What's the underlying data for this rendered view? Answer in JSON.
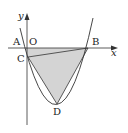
{
  "diagram": {
    "type": "parabola-triangle",
    "axes": {
      "x_label": "x",
      "y_label": "y",
      "origin_label": "O"
    },
    "points": [
      {
        "name": "A",
        "label": "A"
      },
      {
        "name": "B",
        "label": "B"
      },
      {
        "name": "C",
        "label": "C"
      },
      {
        "name": "D",
        "label": "D"
      }
    ],
    "shaded_region": "A-B-D triangle region with C",
    "colors": {
      "shade": "#d4d4d4",
      "line": "#333333",
      "background": "#ffffff"
    }
  }
}
